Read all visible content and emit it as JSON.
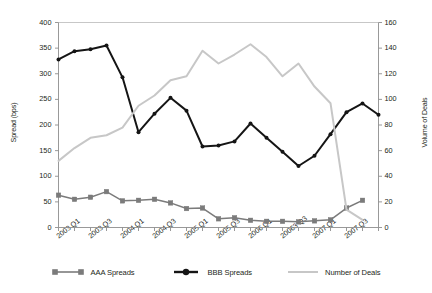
{
  "chart_data": {
    "type": "line",
    "title": "",
    "xlabel": "",
    "ylabel": "Spread (bps)",
    "y2label": "Volume of Deals",
    "ylim": [
      0,
      400
    ],
    "y2lim": [
      0,
      160
    ],
    "grid": false,
    "legend_position": "bottom",
    "categories": [
      "2003 Q1",
      "2003 Q2",
      "2003 Q3",
      "2003 Q4",
      "2004 Q1",
      "2004 Q2",
      "2004 Q3",
      "2004 Q4",
      "2005 Q1",
      "2005 Q2",
      "2005 Q3",
      "2005 Q4",
      "2006 Q1",
      "2006 Q2",
      "20063 Q3",
      "2006 Q4",
      "2007 Q1",
      "2007 Q2",
      "2007 Q3",
      "2007 Q4",
      "2008 Q1"
    ],
    "xtick_labels": [
      "2003 Q1",
      "2003 Q3",
      "2004 Q1",
      "2004 Q3",
      "2005 Q1",
      "2005 Q3",
      "2006 Q1",
      "20063 Q3",
      "2007 Q1",
      "2007 Q3"
    ],
    "xtick_indices": [
      0,
      2,
      4,
      6,
      8,
      10,
      12,
      14,
      16,
      18
    ],
    "ytick_labels_left": [
      "400",
      "350",
      "300",
      "250",
      "200",
      "150",
      "100",
      "50",
      "0"
    ],
    "ytick_values_left": [
      400,
      350,
      300,
      250,
      200,
      150,
      100,
      50,
      0
    ],
    "ytick_labels_right": [
      "160",
      "140",
      "120",
      "100",
      "80",
      "60",
      "40",
      "20",
      "0"
    ],
    "ytick_values_right": [
      160,
      140,
      120,
      100,
      80,
      60,
      40,
      20,
      0
    ],
    "series": [
      {
        "name": "AAA Spreads",
        "axis": "left",
        "color": "#7b7b7b",
        "marker": "square",
        "values": [
          63,
          55,
          59,
          70,
          52,
          53,
          55,
          48,
          37,
          38,
          17,
          19,
          14,
          12,
          12,
          11,
          13,
          15,
          38,
          53,
          null
        ]
      },
      {
        "name": "BBB Spreads",
        "axis": "left",
        "color": "#151515",
        "marker": "circle",
        "values": [
          328,
          344,
          348,
          355,
          293,
          186,
          222,
          253,
          228,
          158,
          160,
          168,
          203,
          175,
          148,
          120,
          140,
          182,
          225,
          242,
          220
        ]
      },
      {
        "name": "Number of Deals",
        "axis": "right",
        "color": "#c7c7c7",
        "marker": "none",
        "values": [
          52,
          62,
          70,
          72,
          78,
          95,
          103,
          115,
          118,
          138,
          128,
          135,
          143,
          133,
          118,
          128,
          110,
          97,
          14,
          6,
          null
        ]
      }
    ],
    "legend": [
      {
        "label": "AAA Spreads",
        "color": "#7b7b7b",
        "marker": "square"
      },
      {
        "label": "BBB Spreads",
        "color": "#151515",
        "marker": "circle"
      },
      {
        "label": "Number of Deals",
        "color": "#c7c7c7",
        "marker": "none"
      }
    ]
  }
}
